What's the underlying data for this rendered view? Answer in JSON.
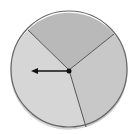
{
  "diagram": {
    "type": "spinner",
    "center": [
      69,
      70
    ],
    "radius": 58,
    "sections": [
      {
        "name": "top",
        "color": "#b9b9b9",
        "start_angle_deg": -134,
        "end_angle_deg": -47
      },
      {
        "name": "right",
        "color": "#c8c8c8",
        "start_angle_deg": -47,
        "end_angle_deg": 73
      },
      {
        "name": "left",
        "color": "#d6d6d6",
        "start_angle_deg": 73,
        "end_angle_deg": 226
      }
    ],
    "divider_color": "#555555",
    "outline_color": "#666666",
    "arrow": {
      "direction": "left",
      "tip": [
        32,
        71
      ],
      "color": "#111111"
    }
  }
}
